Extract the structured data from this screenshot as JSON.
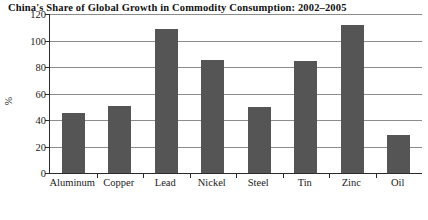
{
  "chart_data": {
    "type": "bar",
    "title": "China's Share of Global Growth in Commodity Consumption: 2002–2005",
    "xlabel": "",
    "ylabel": "%",
    "categories": [
      "Aluminum",
      "Copper",
      "Lead",
      "Nickel",
      "Steel",
      "Tin",
      "Zinc",
      "Oil"
    ],
    "values": [
      45,
      50.5,
      109,
      85.5,
      50,
      84.5,
      112,
      28.5
    ],
    "ylim": [
      0,
      120
    ],
    "yticks": [
      0,
      20,
      40,
      60,
      80,
      100,
      120
    ],
    "ytick_labels": [
      "0",
      "20",
      "40",
      "60",
      "80",
      "100",
      "120"
    ],
    "grid": "horizontal",
    "legend": "none",
    "bar_color": "#555555",
    "gridline_color": "#8c8c8c",
    "axis_color": "#2b2b2b",
    "background_color": "#ffffff"
  }
}
